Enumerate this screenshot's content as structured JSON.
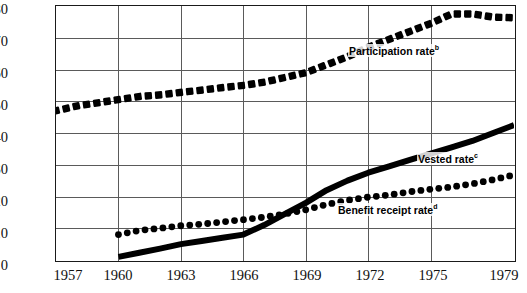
{
  "chart_data": {
    "type": "line",
    "title": "",
    "xlabel": "",
    "ylabel": "percent",
    "xlim": [
      1957,
      1979
    ],
    "ylim": [
      0,
      80
    ],
    "yticks": [
      0,
      10,
      20,
      30,
      40,
      50,
      60,
      70,
      80
    ],
    "xticks": [
      1957,
      1960,
      1963,
      1966,
      1969,
      1972,
      1975,
      1979
    ],
    "grid": true,
    "legend_position": "inline-annotations",
    "x": [
      1957,
      1958,
      1959,
      1960,
      1961,
      1962,
      1963,
      1964,
      1965,
      1966,
      1967,
      1968,
      1969,
      1970,
      1971,
      1972,
      1973,
      1974,
      1975,
      1976,
      1977,
      1978,
      1979
    ],
    "series": [
      {
        "name": "Participation rate",
        "footnote": "b",
        "style": "thick-dashed",
        "values": [
          47,
          48.5,
          49.5,
          50.5,
          51.5,
          52,
          52.8,
          53.5,
          54.3,
          55,
          56,
          57.5,
          59,
          61.5,
          64,
          67,
          69.5,
          72,
          74.5,
          77.5,
          77.5,
          76.5,
          76.3
        ]
      },
      {
        "name": "Vested rate",
        "footnote": "c",
        "style": "thick-solid",
        "values": [
          null,
          null,
          null,
          1,
          2.3,
          3.6,
          5,
          6,
          7,
          8,
          11,
          14.5,
          18,
          22,
          25,
          27.5,
          29.5,
          31.5,
          33.5,
          35.5,
          37.5,
          40,
          42.5
        ]
      },
      {
        "name": "Benefit receipt rate",
        "footnote": "d",
        "style": "dotted",
        "values": [
          null,
          null,
          null,
          8,
          9.3,
          10,
          10.8,
          11.3,
          12,
          12.7,
          13.5,
          14.5,
          15.8,
          17.5,
          18.8,
          19.8,
          20.5,
          21.5,
          22.3,
          23,
          24,
          25.3,
          26.8
        ]
      }
    ]
  },
  "annotations": {
    "participation_label": "Participation rate",
    "participation_footnote": "b",
    "vested_label": "Vested rate",
    "vested_footnote": "c",
    "benefit_label": "Benefit receipt rate",
    "benefit_footnote": "d"
  },
  "axis": {
    "y_title": "percent",
    "y_ticks": [
      "0",
      "10",
      "20",
      "30",
      "40",
      "50",
      "60",
      "70",
      "80"
    ],
    "x_ticks": [
      "1957",
      "1960",
      "1963",
      "1966",
      "1969",
      "1972",
      "1975",
      "1979"
    ]
  },
  "colors": {
    "ink": "#000000",
    "grid": "#5a5a5a",
    "frame": "#1a1a1a",
    "background": "#ffffff"
  }
}
